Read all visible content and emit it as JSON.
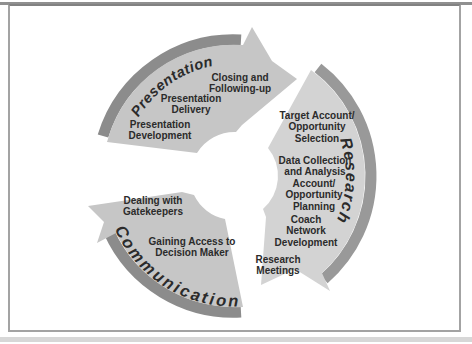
{
  "figure": {
    "type": "circular-process-cycle-diagram",
    "frame_border_color": "#a3a3a3",
    "background": "#ffffff"
  },
  "colors": {
    "presentation_body": "#c6c6c6",
    "research_body": "#d3d3d3",
    "communication_body": "#c6c6c6",
    "presentation_rim": "#8c8c8c",
    "research_rim": "#999999",
    "communication_rim": "#8c8c8c",
    "ring_text": "#2b2b2b",
    "label_text": "#2b2b2b"
  },
  "cycle": {
    "research": {
      "label": "Research",
      "steps": {
        "target": "Target Account/\nOpportunity\nSelection",
        "data": "Data Collection\nand Analysis",
        "account": "Account/\nOpportunity\nPlanning",
        "coach": "Coach\nNetwork\nDevelopment",
        "meetings": "Research\nMeetings"
      }
    },
    "communication": {
      "label": "Communication",
      "steps": {
        "gatekeepers": "Dealing with\nGatekeepers",
        "access": "Gaining Access to\nDecision Maker"
      }
    },
    "presentation": {
      "label": "Presentation",
      "steps": {
        "development": "Presentation\nDevelopment",
        "delivery": "Presentation\nDelivery",
        "closing": "Closing and\nFollowing-up"
      }
    }
  }
}
